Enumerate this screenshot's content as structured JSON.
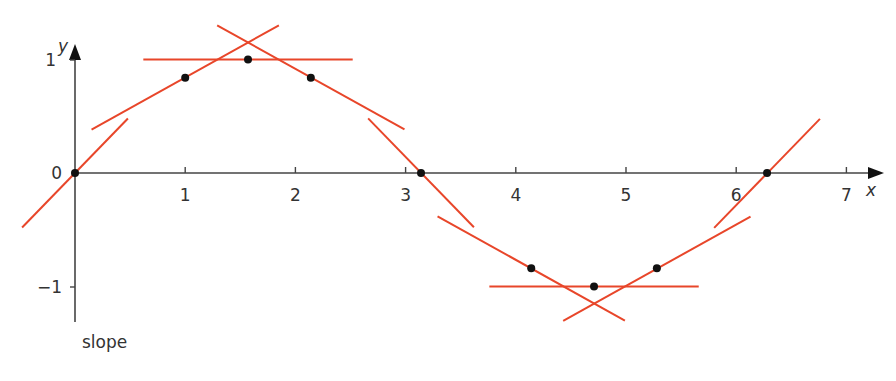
{
  "chart_data": {
    "type": "line",
    "title": "",
    "function": "y = sin(x) with tangent lines",
    "xlabel": "x",
    "ylabel": "y",
    "xlim": [
      0,
      7.3
    ],
    "ylim": [
      -1.3,
      1.2
    ],
    "x_ticks": [
      "1",
      "2",
      "3",
      "4",
      "5",
      "6",
      "7"
    ],
    "y_ticks": [
      "1",
      "0",
      "−1"
    ],
    "points": [
      {
        "x": 0,
        "y": 0
      },
      {
        "x": 1,
        "y": 0.84
      },
      {
        "x": 1.57,
        "y": 1
      },
      {
        "x": 2.14,
        "y": 0.84
      },
      {
        "x": 3.14,
        "y": 0
      },
      {
        "x": 4.14,
        "y": -0.84
      },
      {
        "x": 4.71,
        "y": -1
      },
      {
        "x": 5.28,
        "y": -0.84
      },
      {
        "x": 6.28,
        "y": 0
      }
    ],
    "tangents": [
      {
        "x": 0,
        "slope": 1
      },
      {
        "x": 1,
        "slope": 0.54
      },
      {
        "x": 1.57,
        "slope": 0
      },
      {
        "x": 2.14,
        "slope": -0.54
      },
      {
        "x": 3.14,
        "slope": -1
      },
      {
        "x": 4.14,
        "slope": -0.54
      },
      {
        "x": 4.71,
        "slope": 0
      },
      {
        "x": 5.28,
        "slope": 0.54
      },
      {
        "x": 6.28,
        "slope": 1
      }
    ],
    "grid": false,
    "legend": null
  },
  "axes": {
    "x_name": "x",
    "y_name": "y",
    "origin_label": "0"
  },
  "caption": "slope",
  "colors": {
    "tangent": "#e8462a",
    "axis": "#444444",
    "point": "#111111"
  }
}
